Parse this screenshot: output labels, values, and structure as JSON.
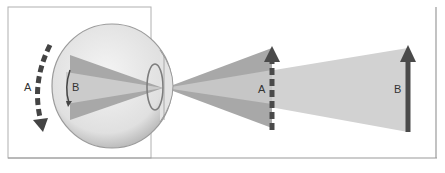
{
  "diagram": {
    "labels": {
      "retina_arc_outer": "A",
      "retina_arc_inner": "B",
      "object_near": "A",
      "object_far": "B"
    },
    "colors": {
      "frame": "#9a9a9a",
      "eyeball_fill": "#e6e6e6",
      "eyeball_stroke": "#8c8c8c",
      "cone_dark": "#a9a9a9",
      "cone_light": "#cfcfcf",
      "arrow": "#4a4a4a"
    }
  }
}
